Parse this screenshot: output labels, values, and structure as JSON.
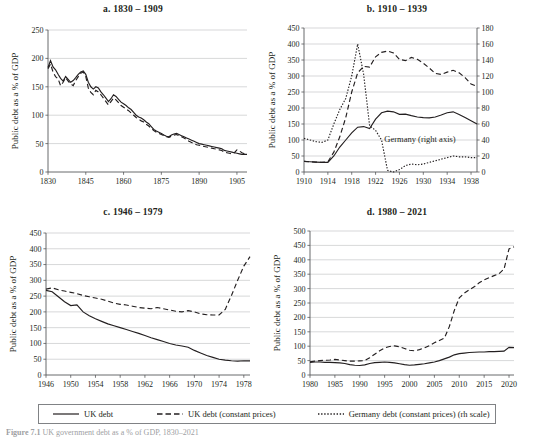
{
  "figure": {
    "caption_label": "Figure",
    "caption_number": "7.1",
    "caption_text": "UK government debt as a % of GDP, 1830–2021"
  },
  "legend": {
    "items": [
      {
        "label": "UK debt",
        "style": "solid",
        "color": "#231f20"
      },
      {
        "label": "UK debt (constant prices)",
        "style": "dashed",
        "color": "#231f20"
      },
      {
        "label": "Germany debt (constant prices) (rh scale)",
        "style": "dotted",
        "color": "#231f20"
      }
    ]
  },
  "chart_data": [
    {
      "id": "a",
      "type": "line",
      "title": "a. 1830 – 1909",
      "xlabel": "",
      "ylabel": "Public debt as a % of GDP",
      "xlim": [
        1830,
        1909
      ],
      "ylim": [
        0,
        250
      ],
      "yticks": [
        0,
        50,
        100,
        150,
        200,
        250
      ],
      "xticks": [
        1830,
        1845,
        1860,
        1875,
        1890,
        1905
      ],
      "grid": true,
      "legend_position": "figure-bottom",
      "x": [
        1830,
        1831,
        1832,
        1833,
        1834,
        1835,
        1836,
        1837,
        1838,
        1839,
        1840,
        1841,
        1842,
        1843,
        1844,
        1845,
        1846,
        1847,
        1848,
        1849,
        1850,
        1851,
        1852,
        1853,
        1854,
        1855,
        1856,
        1857,
        1858,
        1859,
        1860,
        1861,
        1862,
        1863,
        1864,
        1865,
        1866,
        1867,
        1868,
        1869,
        1870,
        1871,
        1872,
        1873,
        1874,
        1875,
        1876,
        1877,
        1878,
        1879,
        1880,
        1881,
        1882,
        1883,
        1884,
        1885,
        1886,
        1887,
        1888,
        1889,
        1890,
        1891,
        1892,
        1893,
        1894,
        1895,
        1896,
        1897,
        1898,
        1899,
        1900,
        1901,
        1902,
        1903,
        1904,
        1905,
        1906,
        1907,
        1908,
        1909
      ],
      "series": [
        {
          "name": "UK debt",
          "style": "solid",
          "values": [
            184,
            196,
            185,
            180,
            172,
            165,
            160,
            168,
            163,
            158,
            161,
            166,
            172,
            176,
            178,
            172,
            158,
            150,
            146,
            150,
            148,
            141,
            136,
            130,
            124,
            129,
            136,
            133,
            128,
            123,
            120,
            117,
            113,
            110,
            105,
            100,
            97,
            95,
            92,
            88,
            85,
            80,
            75,
            72,
            70,
            68,
            65,
            63,
            62,
            65,
            67,
            68,
            66,
            64,
            62,
            60,
            58,
            56,
            54,
            52,
            50,
            49,
            48,
            47,
            46,
            45,
            44,
            43,
            42,
            41,
            38,
            37,
            36,
            35,
            34,
            33,
            32,
            31,
            31,
            31
          ]
        },
        {
          "name": "UK debt (constant prices)",
          "style": "dashed",
          "values": [
            182,
            190,
            176,
            168,
            164,
            152,
            158,
            166,
            160,
            155,
            152,
            161,
            168,
            174,
            176,
            168,
            148,
            140,
            136,
            144,
            141,
            136,
            130,
            124,
            118,
            124,
            130,
            127,
            122,
            117,
            114,
            111,
            108,
            104,
            100,
            96,
            93,
            90,
            88,
            84,
            81,
            77,
            73,
            70,
            68,
            66,
            64,
            62,
            61,
            63,
            65,
            66,
            64,
            62,
            60,
            57,
            54,
            52,
            50,
            48,
            47,
            46,
            45,
            44,
            43,
            42,
            41,
            40,
            39,
            38,
            35,
            34,
            33,
            32,
            34,
            39,
            37,
            34,
            32,
            31
          ]
        }
      ]
    },
    {
      "id": "b",
      "type": "line",
      "title": "b. 1910 – 1939",
      "xlabel": "",
      "ylabel": "Public debt as a % of GDP",
      "xlim": [
        1910,
        1939
      ],
      "ylim": [
        0,
        450
      ],
      "yticks": [
        0,
        50,
        100,
        150,
        200,
        250,
        300,
        350,
        400,
        450
      ],
      "ylim_right": [
        0,
        180
      ],
      "yticks_right": [
        0,
        20,
        40,
        60,
        80,
        100,
        120,
        140,
        160,
        180
      ],
      "xticks": [
        1910,
        1914,
        1918,
        1922,
        1926,
        1930,
        1934,
        1938
      ],
      "grid": true,
      "annotation": "Germany (right axis)",
      "x": [
        1910,
        1911,
        1912,
        1913,
        1914,
        1915,
        1916,
        1917,
        1918,
        1919,
        1920,
        1921,
        1922,
        1923,
        1924,
        1925,
        1926,
        1927,
        1928,
        1929,
        1930,
        1931,
        1932,
        1933,
        1934,
        1935,
        1936,
        1937,
        1938,
        1939
      ],
      "series": [
        {
          "name": "UK debt",
          "style": "solid",
          "axis": "left",
          "values": [
            33,
            32,
            31,
            30,
            30,
            50,
            78,
            100,
            122,
            140,
            142,
            136,
            165,
            185,
            190,
            188,
            180,
            181,
            176,
            172,
            170,
            169,
            172,
            178,
            185,
            188,
            180,
            170,
            160,
            150
          ]
        },
        {
          "name": "UK debt (constant prices)",
          "style": "dashed",
          "axis": "left",
          "values": [
            33,
            32,
            31,
            30,
            32,
            62,
            110,
            170,
            250,
            310,
            330,
            328,
            360,
            374,
            378,
            372,
            352,
            348,
            358,
            352,
            340,
            325,
            308,
            305,
            312,
            318,
            310,
            295,
            275,
            268
          ]
        },
        {
          "name": "Germany debt (constant prices) (rh scale)",
          "style": "dotted",
          "axis": "right",
          "values": [
            42,
            40,
            38,
            37,
            40,
            60,
            78,
            92,
            120,
            160,
            122,
            58,
            52,
            40,
            2,
            0,
            3,
            8,
            10,
            9,
            10,
            12,
            14,
            16,
            18,
            20,
            19,
            19,
            18,
            18
          ]
        }
      ]
    },
    {
      "id": "c",
      "type": "line",
      "title": "c. 1946 – 1979",
      "xlabel": "",
      "ylabel": "Public debt as a % of GDP",
      "xlim": [
        1946,
        1979
      ],
      "ylim": [
        0,
        450
      ],
      "yticks": [
        0,
        50,
        100,
        150,
        200,
        250,
        300,
        350,
        400,
        450
      ],
      "xticks": [
        1946,
        1950,
        1954,
        1958,
        1962,
        1966,
        1970,
        1974,
        1978
      ],
      "grid": true,
      "x": [
        1946,
        1947,
        1948,
        1949,
        1950,
        1951,
        1952,
        1953,
        1954,
        1955,
        1956,
        1957,
        1958,
        1959,
        1960,
        1961,
        1962,
        1963,
        1964,
        1965,
        1966,
        1967,
        1968,
        1969,
        1970,
        1971,
        1972,
        1973,
        1974,
        1975,
        1976,
        1977,
        1978,
        1979
      ],
      "series": [
        {
          "name": "UK debt",
          "style": "solid",
          "values": [
            268,
            264,
            248,
            232,
            220,
            222,
            200,
            188,
            178,
            170,
            162,
            156,
            150,
            144,
            138,
            132,
            125,
            118,
            112,
            106,
            100,
            95,
            92,
            88,
            78,
            70,
            62,
            56,
            50,
            47,
            45,
            44,
            45,
            45
          ]
        },
        {
          "name": "UK debt (constant prices)",
          "style": "dashed",
          "values": [
            272,
            276,
            270,
            266,
            262,
            258,
            252,
            248,
            244,
            240,
            234,
            228,
            224,
            222,
            218,
            214,
            212,
            210,
            214,
            210,
            206,
            202,
            200,
            204,
            200,
            194,
            191,
            190,
            190,
            208,
            252,
            300,
            345,
            375
          ]
        }
      ]
    },
    {
      "id": "d",
      "type": "line",
      "title": "d. 1980 – 2021",
      "xlabel": "",
      "ylabel": "Public debt as a % of GDP",
      "xlim": [
        1980,
        2021
      ],
      "ylim": [
        0,
        500
      ],
      "yticks": [
        0,
        50,
        100,
        150,
        200,
        250,
        300,
        350,
        400,
        450,
        500
      ],
      "xticks": [
        1980,
        1985,
        1990,
        1995,
        2000,
        2005,
        2010,
        2015,
        2020
      ],
      "grid": true,
      "x": [
        1980,
        1981,
        1982,
        1983,
        1984,
        1985,
        1986,
        1987,
        1988,
        1989,
        1990,
        1991,
        1992,
        1993,
        1994,
        1995,
        1996,
        1997,
        1998,
        1999,
        2000,
        2001,
        2002,
        2003,
        2004,
        2005,
        2006,
        2007,
        2008,
        2009,
        2010,
        2011,
        2012,
        2013,
        2014,
        2015,
        2016,
        2017,
        2018,
        2019,
        2020,
        2021
      ],
      "series": [
        {
          "name": "UK debt",
          "style": "solid",
          "values": [
            44,
            45,
            45,
            44,
            44,
            43,
            42,
            40,
            36,
            34,
            33,
            35,
            40,
            43,
            44,
            45,
            44,
            42,
            39,
            36,
            34,
            35,
            37,
            39,
            42,
            45,
            50,
            56,
            62,
            70,
            74,
            76,
            78,
            79,
            80,
            80,
            81,
            81,
            82,
            83,
            96,
            95
          ]
        },
        {
          "name": "UK debt (constant prices)",
          "style": "dashed",
          "values": [
            46,
            48,
            50,
            51,
            52,
            54,
            52,
            50,
            48,
            48,
            49,
            50,
            60,
            72,
            84,
            94,
            99,
            101,
            98,
            92,
            86,
            84,
            88,
            94,
            102,
            112,
            120,
            128,
            168,
            224,
            268,
            284,
            296,
            306,
            320,
            330,
            338,
            345,
            352,
            368,
            438,
            445
          ]
        }
      ]
    }
  ]
}
